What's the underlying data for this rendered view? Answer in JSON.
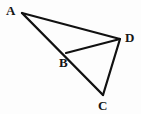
{
  "figure": {
    "type": "geometry-diagram",
    "background_color": "#fdfdfd",
    "stroke_color": "#111111",
    "stroke_width": 2.2,
    "canvas": {
      "width": 141,
      "height": 114
    },
    "points": [
      {
        "id": "A",
        "label": "A",
        "x": 22,
        "y": 13,
        "label_x": 6,
        "label_y": 4
      },
      {
        "id": "B",
        "label": "B",
        "x": 66,
        "y": 53,
        "label_x": 59,
        "label_y": 56
      },
      {
        "id": "C",
        "label": "C",
        "x": 103,
        "y": 95,
        "label_x": 98,
        "label_y": 99
      },
      {
        "id": "D",
        "label": "D",
        "x": 120,
        "y": 39,
        "label_x": 125,
        "label_y": 31
      }
    ],
    "segments": [
      {
        "id": "AD",
        "from": "A",
        "to": "D"
      },
      {
        "id": "AC",
        "from": "A",
        "to": "C"
      },
      {
        "id": "BD",
        "from": "B",
        "to": "D"
      },
      {
        "id": "CD",
        "from": "C",
        "to": "D"
      }
    ],
    "labels": {
      "a": "A",
      "b": "B",
      "c": "C",
      "d": "D"
    }
  }
}
